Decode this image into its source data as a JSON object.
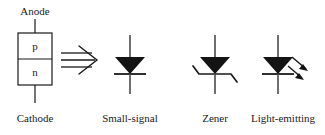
{
  "figure": {
    "background_color": "#ffffff",
    "ink_color": "#1a1a1a",
    "fill_color": "#141414"
  },
  "junction": {
    "anode_label": "Anode",
    "cathode_label": "Cathode",
    "p_region_label": "p",
    "n_region_label": "n"
  },
  "implication": {
    "icon_name": "triple-line-rightwards-arrow"
  },
  "symbols": [
    {
      "caption": "Small-signal",
      "icon_name": "diode-symbol",
      "cathode_bar_style": "straight"
    },
    {
      "caption": "Zener",
      "icon_name": "zener-diode-symbol",
      "cathode_bar_style": "z-bent"
    },
    {
      "caption": "Light-emitting",
      "icon_name": "led-symbol",
      "cathode_bar_style": "straight",
      "emission_arrows": 2
    }
  ]
}
